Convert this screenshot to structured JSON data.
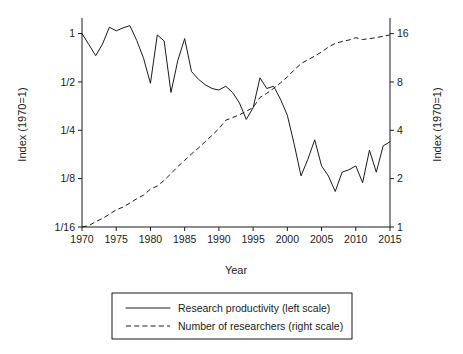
{
  "chart_data": {
    "type": "line",
    "title": "",
    "xlabel": "Year",
    "ylabel": "Index (1970=1)",
    "ylabel_right": "Index (1970=1)",
    "xlim": [
      1970,
      2015
    ],
    "xticks": [
      1970,
      1975,
      1980,
      1985,
      1990,
      1995,
      2000,
      2005,
      2010,
      2015
    ],
    "xticklabels": [
      "1970",
      "1975",
      "1980",
      "1985",
      "1990",
      "1995",
      "2000",
      "2005",
      "2010",
      "2015"
    ],
    "yscale": "log2",
    "ylim_left": [
      0.0625,
      1.18
    ],
    "yticks_left": [
      1,
      0.5,
      0.25,
      0.125,
      0.0625
    ],
    "yticklabels_left": [
      "1",
      "1/2",
      "1/4",
      "1/8",
      "1/16"
    ],
    "ylim_right": [
      1,
      18.9
    ],
    "yticks_right": [
      16,
      8,
      4,
      2,
      1
    ],
    "yticklabels_right": [
      "16",
      "8",
      "4",
      "2",
      "1"
    ],
    "grid": false,
    "legend_position": "below",
    "series": [
      {
        "name": "Research productivity (left scale)",
        "legend_label": "Research productivity (left scale)",
        "axis": "left",
        "style": "solid",
        "color": "#1a1a1a",
        "x": [
          1970,
          1971,
          1972,
          1973,
          1974,
          1975,
          1976,
          1977,
          1978,
          1979,
          1980,
          1981,
          1982,
          1983,
          1984,
          1985,
          1986,
          1987,
          1988,
          1989,
          1990,
          1991,
          1992,
          1993,
          1994,
          1995,
          1996,
          1997,
          1998,
          1999,
          2000,
          2001,
          2002,
          2003,
          2004,
          2005,
          2006,
          2007,
          2008,
          2009,
          2010,
          2011,
          2012,
          2013,
          2014,
          2015
        ],
        "y": [
          1.0,
          0.855,
          0.728,
          0.86,
          1.095,
          1.04,
          1.085,
          1.12,
          0.905,
          0.7,
          0.49,
          0.98,
          0.9,
          0.43,
          0.68,
          0.93,
          0.58,
          0.52,
          0.48,
          0.455,
          0.445,
          0.47,
          0.43,
          0.37,
          0.292,
          0.345,
          0.53,
          0.455,
          0.47,
          0.39,
          0.31,
          0.205,
          0.13,
          0.165,
          0.218,
          0.15,
          0.13,
          0.104,
          0.137,
          0.142,
          0.15,
          0.118,
          0.188,
          0.137,
          0.2,
          0.212
        ]
      },
      {
        "name": "Number of researchers (right scale)",
        "legend_label": "Number of researchers (right scale)",
        "axis": "right",
        "style": "dashed",
        "color": "#1a1a1a",
        "x": [
          1970,
          1971,
          1972,
          1973,
          1974,
          1975,
          1976,
          1977,
          1978,
          1979,
          1980,
          1981,
          1982,
          1983,
          1984,
          1985,
          1986,
          1987,
          1988,
          1989,
          1990,
          1991,
          1992,
          1993,
          1994,
          1995,
          1996,
          1997,
          1998,
          1999,
          2000,
          2001,
          2002,
          2003,
          2004,
          2005,
          2006,
          2007,
          2008,
          2009,
          2010,
          2011,
          2012,
          2013,
          2014,
          2015
        ],
        "y": [
          1.0,
          1.02,
          1.08,
          1.13,
          1.2,
          1.28,
          1.33,
          1.41,
          1.5,
          1.58,
          1.72,
          1.8,
          1.95,
          2.15,
          2.38,
          2.6,
          2.85,
          3.1,
          3.4,
          3.72,
          4.1,
          4.62,
          4.8,
          5.0,
          5.25,
          5.55,
          6.4,
          6.8,
          7.3,
          7.9,
          8.6,
          9.5,
          10.4,
          11.0,
          11.6,
          12.3,
          13.2,
          13.9,
          14.3,
          14.6,
          15.1,
          14.7,
          14.9,
          15.1,
          15.4,
          15.7
        ]
      }
    ]
  },
  "axes": {
    "ylabel_left": "Index (1970=1)",
    "ylabel_right": "Index (1970=1)",
    "xlabel": "Year"
  },
  "legend": {
    "items": [
      {
        "label": "Research productivity (left scale)",
        "style": "solid"
      },
      {
        "label": "Number of researchers (right scale)",
        "style": "dashed"
      }
    ]
  }
}
